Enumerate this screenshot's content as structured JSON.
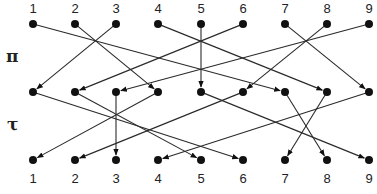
{
  "diagram": {
    "type": "permutation-composition",
    "row_symbols": {
      "pi": "π",
      "tau": "τ"
    },
    "top_labels": [
      "1",
      "2",
      "3",
      "4",
      "5",
      "6",
      "7",
      "8",
      "9"
    ],
    "bottom_labels": [
      "1",
      "2",
      "3",
      "4",
      "5",
      "6",
      "7",
      "8",
      "9"
    ],
    "node_x": [
      33,
      75,
      116,
      158,
      201,
      243,
      285,
      327,
      369
    ],
    "row_y": {
      "top": 24,
      "middle": 92,
      "bottom": 160
    },
    "pi_mapping": {
      "1": 7,
      "2": 4,
      "3": 1,
      "4": 8,
      "5": 5,
      "6": 2,
      "7": 9,
      "8": 6,
      "9": 3
    },
    "tau_mapping": {
      "1": 6,
      "2": 5,
      "3": 3,
      "4": 1,
      "5": 9,
      "6": 2,
      "7": 8,
      "8": 7,
      "9": 4
    },
    "colors": {
      "line": "#2a2a2a",
      "node": "#111111"
    }
  }
}
